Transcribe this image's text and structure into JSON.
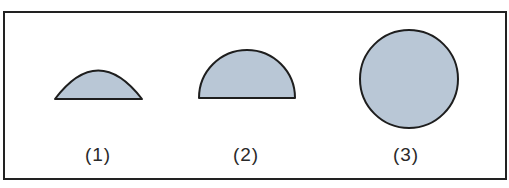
{
  "figure": {
    "shapes": [
      {
        "id": 1,
        "type": "circular-segment",
        "label": "(1)",
        "description": "low dome (minor circular segment)"
      },
      {
        "id": 2,
        "type": "semicircle",
        "label": "(2)",
        "description": "half circle"
      },
      {
        "id": 3,
        "type": "circle",
        "label": "(3)",
        "description": "full circle"
      }
    ],
    "colors": {
      "fill": "#b9c7d6",
      "stroke": "#1e1e1e",
      "frame": "#222222"
    }
  }
}
